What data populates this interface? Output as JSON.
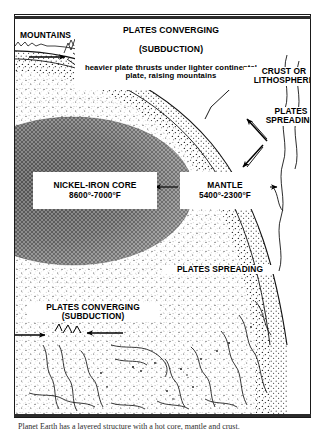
{
  "figure": {
    "background_color": "#ffffff",
    "border_color": "#1a1a1a"
  },
  "labels": {
    "header": {
      "line1": "PLATES CONVERGING",
      "line2": "(SUBDUCTION)",
      "line3": "heavier plate thrusts under lighter continental plate, raising mountains"
    },
    "mountains": "MOUNTAINS",
    "crust": "CRUST OR\nLITHOSPHERE",
    "spreading_top": "PLATES\nSPREADING",
    "core": {
      "name": "NICKEL-IRON CORE",
      "temperature": "8600°-7000°F"
    },
    "mantle": {
      "name": "MANTLE",
      "temperature": "5400°-2300°F"
    },
    "spreading_mid": "PLATES SPREADING",
    "converging_bottom": "PLATES CONVERGING\n(SUBDUCTION)"
  },
  "caption": "Planet Earth has a layered structure with a hot core, mantle and crust.",
  "colors": {
    "core_fill": "#4a4a4a",
    "mantle_fill": "#8c8c8c",
    "crust_fill": "#b5b5b5",
    "ink": "#000000",
    "frame": "#2b2b2b"
  },
  "layers": [
    {
      "name": "nickel-iron-core",
      "shade": "dark-stipple"
    },
    {
      "name": "mantle",
      "shade": "medium-stipple"
    },
    {
      "name": "crust-lithosphere",
      "shade": "light-stipple"
    }
  ],
  "arrows": [
    {
      "name": "subduction-arrow-left",
      "direction": "right"
    },
    {
      "name": "subduction-arrow-right",
      "direction": "left"
    },
    {
      "name": "core-mantle-arrow-left",
      "direction": "left"
    },
    {
      "name": "mantle-crust-arrow-right",
      "direction": "right"
    },
    {
      "name": "spreading-arrow-up",
      "direction": "up-right"
    },
    {
      "name": "spreading-arrow-down",
      "direction": "down-left"
    },
    {
      "name": "converging-arrow-bottom-left",
      "direction": "right"
    },
    {
      "name": "converging-arrow-bottom-right",
      "direction": "left"
    }
  ]
}
